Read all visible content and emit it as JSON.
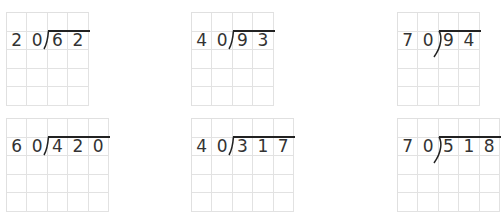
{
  "colors": {
    "grid_line": "#e2e2e2",
    "digit": "#333333",
    "bracket": "#222222"
  },
  "problems": [
    {
      "divisor": [
        "2",
        "0"
      ],
      "dividend": [
        "6",
        "2"
      ],
      "cols": 4,
      "rows": 5,
      "x": 6,
      "y": 12,
      "bracket": "straight"
    },
    {
      "divisor": [
        "4",
        "0"
      ],
      "dividend": [
        "9",
        "3"
      ],
      "cols": 4,
      "rows": 5,
      "x": 191,
      "y": 12,
      "bracket": "straight"
    },
    {
      "divisor": [
        "7",
        "0"
      ],
      "dividend": [
        "9",
        "4"
      ],
      "cols": 4,
      "rows": 5,
      "x": 397,
      "y": 12,
      "bracket": "curved"
    },
    {
      "divisor": [
        "6",
        "0"
      ],
      "dividend": [
        "4",
        "2",
        "0"
      ],
      "cols": 5,
      "rows": 5,
      "x": 6,
      "y": 118,
      "bracket": "straight"
    },
    {
      "divisor": [
        "4",
        "0"
      ],
      "dividend": [
        "3",
        "1",
        "7"
      ],
      "cols": 5,
      "rows": 5,
      "x": 191,
      "y": 118,
      "bracket": "straight"
    },
    {
      "divisor": [
        "7",
        "0"
      ],
      "dividend": [
        "5",
        "1",
        "8"
      ],
      "cols": 5,
      "rows": 5,
      "x": 397,
      "y": 118,
      "bracket": "curved"
    }
  ]
}
